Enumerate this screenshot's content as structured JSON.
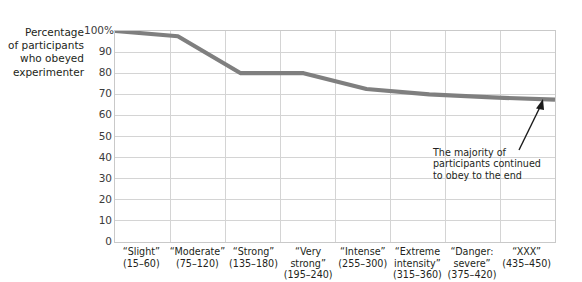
{
  "chart_data": {
    "type": "line",
    "title": "",
    "xlabel": "",
    "ylabel": "Percentage of participants who obeyed experimenter",
    "ylabel_lines": [
      "Percentage",
      "of participants",
      "who obeyed",
      "experimenter"
    ],
    "ylim": [
      0,
      100
    ],
    "yticks": [
      0,
      10,
      20,
      30,
      40,
      50,
      60,
      70,
      80,
      90,
      100
    ],
    "ytick_labels": [
      "0",
      "10",
      "20",
      "30",
      "40",
      "50",
      "60",
      "70",
      "80",
      "90",
      "100%"
    ],
    "grid": true,
    "legend": "none",
    "categories": [
      "“Slight” (15–60)",
      "“Moderate” (75–120)",
      "“Strong” (135–180)",
      "“Very strong” (195–240)",
      "“Intense” (255–300)",
      "“Extreme intensity” (315–360)",
      "“Danger: severe” (375–420)",
      "“XXX” (435–450)"
    ],
    "category_lines": [
      [
        "“Slight”",
        "(15–60)"
      ],
      [
        "“Moderate”",
        "(75–120)"
      ],
      [
        "“Strong”",
        "(135–180)"
      ],
      [
        "“Very",
        "strong”",
        "(195–240)"
      ],
      [
        "“Intense”",
        "(255–300)"
      ],
      [
        "“Extreme",
        "intensity”",
        "(315–360)"
      ],
      [
        "“Danger:",
        "severe”",
        "(375–420)"
      ],
      [
        "“XXX”",
        "(435–450)"
      ]
    ],
    "values": [
      100,
      97.5,
      80,
      80,
      72.5,
      70,
      68.5,
      67.5
    ],
    "series": [
      {
        "name": "Percentage who obeyed",
        "values": [
          100,
          97.5,
          80,
          80,
          72.5,
          70,
          68.5,
          67.5
        ]
      }
    ],
    "annotations": [
      {
        "text": "The majority of participants continued to obey to the end",
        "lines": [
          "The majority of",
          "participants continued",
          "to obey to the end"
        ],
        "points_to_category": "“XXX” (435–450)",
        "points_to_value": 67.5
      }
    ],
    "colors": {
      "line": "#7f7f7f",
      "grid": "#d4d4d4",
      "axis": "#c0c0c0",
      "text": "#231f20",
      "tick_text": "#3b3b3b",
      "background": "#ffffff",
      "arrow": "#1a1a1a"
    }
  }
}
